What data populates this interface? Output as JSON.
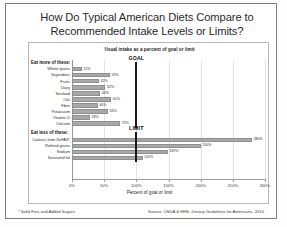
{
  "title": {
    "line1": "How Do Typical American Diets Compare to",
    "line2": "Recommended Intake Levels or Limits?"
  },
  "subtitle": "Usual intake as a percent of goal or limit",
  "footnote": "* Solid Fats and Added Sugars",
  "source": "Source: USDA & HHS, Dietary Guidelines for Americans, 2010",
  "markers": {
    "goal": "GOAL",
    "limit": "LIMIT"
  },
  "groups": {
    "more": "Eat more of these:",
    "less": "Eat less of these:"
  },
  "axis": {
    "xlabel": "Percent of goal or limit",
    "ticks": [
      "0%",
      "50%",
      "100%",
      "150%",
      "200%",
      "250%",
      "300%"
    ]
  },
  "chart_data": {
    "type": "bar",
    "orientation": "horizontal",
    "title": "How Do Typical American Diets Compare to Recommended Intake Levels or Limits?",
    "subtitle": "Usual intake as a percent of goal or limit",
    "xlabel": "Percent of goal or limit",
    "ylabel": "",
    "xlim": [
      0,
      300
    ],
    "xticks": [
      0,
      50,
      100,
      150,
      200,
      250,
      300
    ],
    "grid": true,
    "legend": false,
    "reference_lines": [
      {
        "label": "GOAL",
        "value": 100,
        "group": "Eat more of these:"
      },
      {
        "label": "LIMIT",
        "value": 100,
        "group": "Eat less of these:"
      }
    ],
    "groups": [
      {
        "name": "Eat more of these:",
        "categories": [
          "Whole grains",
          "Vegetables",
          "Fruits",
          "Dairy",
          "Seafood",
          "Oils",
          "Fiber",
          "Potassium",
          "Vitamin D",
          "Calcium"
        ],
        "values": [
          15,
          59,
          42,
          52,
          44,
          61,
          40,
          56,
          28,
          75
        ],
        "labels": [
          "15%",
          "59%",
          "42%",
          "52%",
          "44%",
          "61%",
          "40%",
          "56%",
          "28%",
          "75%"
        ]
      },
      {
        "name": "Eat less of these:",
        "categories": [
          "Calories from SoFAS*",
          "Refined grains",
          "Sodium",
          "Saturated fat"
        ],
        "values": [
          280,
          200,
          149,
          110
        ],
        "labels": [
          "280%",
          "200%",
          "149%",
          "110%"
        ]
      }
    ]
  }
}
